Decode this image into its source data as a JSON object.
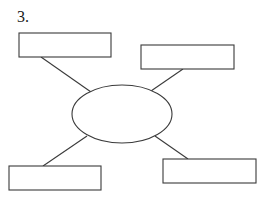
{
  "question": {
    "number_label": "3."
  },
  "diagram": {
    "type": "spider-map",
    "center": {
      "shape": "ellipse",
      "cx": 122,
      "cy": 114,
      "rx": 50,
      "ry": 29,
      "text": ""
    },
    "boxes": [
      {
        "id": "top-left",
        "x": 19,
        "y": 33,
        "w": 92,
        "h": 24,
        "text": ""
      },
      {
        "id": "top-right",
        "x": 141,
        "y": 45,
        "w": 93,
        "h": 24,
        "text": ""
      },
      {
        "id": "bottom-left",
        "x": 9,
        "y": 166,
        "w": 92,
        "h": 24,
        "text": ""
      },
      {
        "id": "bottom-right",
        "x": 163,
        "y": 159,
        "w": 93,
        "h": 24,
        "text": ""
      }
    ],
    "connectors": [
      {
        "from": "top-left",
        "x1": 41,
        "y1": 57,
        "x2": 91,
        "y2": 92
      },
      {
        "from": "top-right",
        "x1": 183,
        "y1": 69,
        "x2": 151,
        "y2": 91
      },
      {
        "from": "bottom-left",
        "x1": 43,
        "y1": 166,
        "x2": 87,
        "y2": 136
      },
      {
        "from": "bottom-right",
        "x1": 188,
        "y1": 159,
        "x2": 155,
        "y2": 136
      }
    ],
    "colors": {
      "stroke": "#3a3a3a",
      "fill": "#ffffff",
      "background": "#ffffff"
    }
  }
}
